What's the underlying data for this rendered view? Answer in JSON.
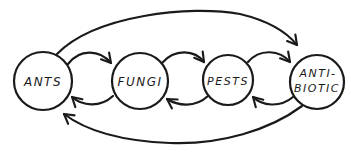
{
  "diagram": {
    "type": "cycle-flow",
    "colors": {
      "stroke": "#1a1a1a",
      "background": "#ffffff"
    },
    "nodes": [
      {
        "id": "ants",
        "label": "ANTS"
      },
      {
        "id": "fungi",
        "label": "FUNGI"
      },
      {
        "id": "pests",
        "label": "PESTS"
      },
      {
        "id": "antibiotic",
        "label_line1": "ANTI-",
        "label_line2": "BIOTIC"
      }
    ],
    "edges": [
      {
        "from": "ants",
        "to": "fungi"
      },
      {
        "from": "fungi",
        "to": "ants"
      },
      {
        "from": "fungi",
        "to": "pests"
      },
      {
        "from": "pests",
        "to": "fungi"
      },
      {
        "from": "pests",
        "to": "antibiotic"
      },
      {
        "from": "antibiotic",
        "to": "pests"
      },
      {
        "from": "ants",
        "to": "antibiotic"
      },
      {
        "from": "antibiotic",
        "to": "ants"
      }
    ]
  }
}
